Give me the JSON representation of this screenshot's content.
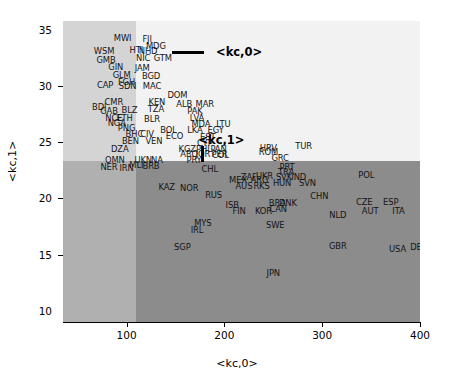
{
  "chart_data": {
    "type": "scatter",
    "title": "",
    "xlabel": "<kc,0>",
    "ylabel": "<kc,1>",
    "xlim": [
      35,
      400
    ],
    "ylim": [
      9.0,
      35.8
    ],
    "xticks": [
      100,
      200,
      300,
      400
    ],
    "yticks": [
      10,
      15,
      20,
      25,
      30,
      35
    ],
    "grid": false,
    "point_label_type": "iso3-country-code",
    "quadrant_split": {
      "x": 110,
      "y": 23.3
    },
    "quadrant_colors": {
      "upper_left": "#d4d4d4",
      "upper_right": "#f2f2f2",
      "lower_left": "#b0b0b0",
      "lower_right": "#8c8c8c"
    },
    "annotations": [
      {
        "text": "<kc,0>",
        "marker": "horizontal-line",
        "x": 215,
        "y": 33.0
      },
      {
        "text": "<kc,1>",
        "marker": "vertical-line",
        "x": 197,
        "y": 25.2
      }
    ],
    "points": [
      {
        "label": "MWI",
        "x": 96,
        "y": 34.3
      },
      {
        "label": "FJI",
        "x": 121,
        "y": 34.2
      },
      {
        "label": "MDG",
        "x": 130,
        "y": 33.6
      },
      {
        "label": "WSM",
        "x": 77,
        "y": 33.1
      },
      {
        "label": "HTI",
        "x": 110,
        "y": 33.2
      },
      {
        "label": "NHD",
        "x": 122,
        "y": 33.1
      },
      {
        "label": "NIC",
        "x": 117,
        "y": 32.5
      },
      {
        "label": "GTM",
        "x": 137,
        "y": 32.5
      },
      {
        "label": "GMB",
        "x": 79,
        "y": 32.3
      },
      {
        "label": "GIN",
        "x": 89,
        "y": 31.7
      },
      {
        "label": "JAM",
        "x": 116,
        "y": 31.6
      },
      {
        "label": "GLM",
        "x": 95,
        "y": 31.0
      },
      {
        "label": "BGD",
        "x": 125,
        "y": 30.9
      },
      {
        "label": "FGH",
        "x": 100,
        "y": 30.4
      },
      {
        "label": "CAP",
        "x": 78,
        "y": 30.1
      },
      {
        "label": "SDN",
        "x": 101,
        "y": 30.0
      },
      {
        "label": "MAC",
        "x": 126,
        "y": 30.0
      },
      {
        "label": "DOM",
        "x": 152,
        "y": 29.2
      },
      {
        "label": "CMR",
        "x": 87,
        "y": 28.6
      },
      {
        "label": "KEN",
        "x": 131,
        "y": 28.6
      },
      {
        "label": "ALB",
        "x": 159,
        "y": 28.4
      },
      {
        "label": "MAR",
        "x": 180,
        "y": 28.4
      },
      {
        "label": "BDI",
        "x": 72,
        "y": 28.1
      },
      {
        "label": "GAB",
        "x": 82,
        "y": 27.8
      },
      {
        "label": "BLZ",
        "x": 103,
        "y": 27.9
      },
      {
        "label": "TZA",
        "x": 130,
        "y": 28.0
      },
      {
        "label": "PAK",
        "x": 170,
        "y": 27.8
      },
      {
        "label": "NCE",
        "x": 87,
        "y": 27.2
      },
      {
        "label": "ETH",
        "x": 98,
        "y": 27.2
      },
      {
        "label": "BLR",
        "x": 126,
        "y": 27.1
      },
      {
        "label": "LVA",
        "x": 172,
        "y": 27.2
      },
      {
        "label": "NGA",
        "x": 90,
        "y": 26.7
      },
      {
        "label": "MDA",
        "x": 176,
        "y": 26.6
      },
      {
        "label": "LTU",
        "x": 199,
        "y": 26.6
      },
      {
        "label": "PNG",
        "x": 100,
        "y": 26.3
      },
      {
        "label": "LKA",
        "x": 170,
        "y": 26.1
      },
      {
        "label": "EGY",
        "x": 191,
        "y": 26.1
      },
      {
        "label": "BOL",
        "x": 143,
        "y": 26.1
      },
      {
        "label": "BHC",
        "x": 108,
        "y": 25.7
      },
      {
        "label": "CIV",
        "x": 121,
        "y": 25.7
      },
      {
        "label": "ECO",
        "x": 149,
        "y": 25.6
      },
      {
        "label": "EST",
        "x": 183,
        "y": 25.5
      },
      {
        "label": "BEN",
        "x": 104,
        "y": 25.1
      },
      {
        "label": "VEN",
        "x": 128,
        "y": 25.1
      },
      {
        "label": "CYP",
        "x": 180,
        "y": 24.9
      },
      {
        "label": "DZA",
        "x": 93,
        "y": 24.4
      },
      {
        "label": "KGZ",
        "x": 162,
        "y": 24.4
      },
      {
        "label": "PHL",
        "x": 179,
        "y": 24.4
      },
      {
        "label": "PAN",
        "x": 194,
        "y": 24.4
      },
      {
        "label": "ARO",
        "x": 164,
        "y": 24.0
      },
      {
        "label": "JOR",
        "x": 178,
        "y": 24.0
      },
      {
        "label": "PER",
        "x": 195,
        "y": 24.0
      },
      {
        "label": "HRV",
        "x": 245,
        "y": 24.5
      },
      {
        "label": "TUR",
        "x": 281,
        "y": 24.7
      },
      {
        "label": "ROM",
        "x": 245,
        "y": 24.1
      },
      {
        "label": "GRC",
        "x": 257,
        "y": 23.6
      },
      {
        "label": "OMN",
        "x": 88,
        "y": 23.4
      },
      {
        "label": "UKN",
        "x": 117,
        "y": 23.4
      },
      {
        "label": "NA",
        "x": 131,
        "y": 23.4
      },
      {
        "label": "PRY",
        "x": 169,
        "y": 23.4
      },
      {
        "label": "COL",
        "x": 196,
        "y": 23.9
      },
      {
        "label": "MLI",
        "x": 110,
        "y": 23.0
      },
      {
        "label": "NER",
        "x": 82,
        "y": 22.8
      },
      {
        "label": "IRN",
        "x": 100,
        "y": 22.7
      },
      {
        "label": "BRB",
        "x": 125,
        "y": 22.9
      },
      {
        "label": "CHL",
        "x": 185,
        "y": 22.6
      },
      {
        "label": "PRT",
        "x": 264,
        "y": 22.8
      },
      {
        "label": "TRA",
        "x": 263,
        "y": 22.4
      },
      {
        "label": "ZAF",
        "x": 225,
        "y": 21.9
      },
      {
        "label": "UKR",
        "x": 241,
        "y": 22.0
      },
      {
        "label": "SVK",
        "x": 261,
        "y": 21.9
      },
      {
        "label": "IND",
        "x": 276,
        "y": 21.9
      },
      {
        "label": "MEX",
        "x": 214,
        "y": 21.6
      },
      {
        "label": "ARG",
        "x": 236,
        "y": 21.6
      },
      {
        "label": "HUN",
        "x": 259,
        "y": 21.4
      },
      {
        "label": "SVN",
        "x": 285,
        "y": 21.4
      },
      {
        "label": "POL",
        "x": 345,
        "y": 22.1
      },
      {
        "label": "AUS",
        "x": 220,
        "y": 21.1
      },
      {
        "label": "RKS",
        "x": 238,
        "y": 21.1
      },
      {
        "label": "KAZ",
        "x": 141,
        "y": 21.0
      },
      {
        "label": "NOR",
        "x": 164,
        "y": 20.9
      },
      {
        "label": "RUS",
        "x": 189,
        "y": 20.3
      },
      {
        "label": "CHN",
        "x": 297,
        "y": 20.2
      },
      {
        "label": "BRA",
        "x": 254,
        "y": 19.6
      },
      {
        "label": "DNK",
        "x": 265,
        "y": 19.6
      },
      {
        "label": "CZE",
        "x": 343,
        "y": 19.7
      },
      {
        "label": "ESP",
        "x": 370,
        "y": 19.7
      },
      {
        "label": "ISB",
        "x": 208,
        "y": 19.4
      },
      {
        "label": "CAN",
        "x": 255,
        "y": 19.1
      },
      {
        "label": "FIN",
        "x": 215,
        "y": 18.9
      },
      {
        "label": "KOR",
        "x": 240,
        "y": 18.9
      },
      {
        "label": "AUT",
        "x": 349,
        "y": 18.9
      },
      {
        "label": "ITA",
        "x": 378,
        "y": 18.9
      },
      {
        "label": "NLD",
        "x": 316,
        "y": 18.5
      },
      {
        "label": "MYS",
        "x": 178,
        "y": 17.8
      },
      {
        "label": "IRL",
        "x": 172,
        "y": 17.2
      },
      {
        "label": "SWE",
        "x": 252,
        "y": 17.6
      },
      {
        "label": "SGP",
        "x": 157,
        "y": 15.7
      },
      {
        "label": "GBR",
        "x": 316,
        "y": 15.8
      },
      {
        "label": "USA",
        "x": 377,
        "y": 15.5
      },
      {
        "label": "DEU",
        "x": 399,
        "y": 15.7
      },
      {
        "label": "JPN",
        "x": 250,
        "y": 13.4
      }
    ]
  }
}
